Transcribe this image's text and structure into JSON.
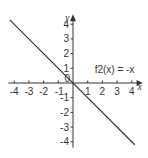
{
  "chart_data": {
    "type": "line",
    "title": "",
    "xlabel": "x",
    "ylabel": "y",
    "xlim": [
      -4.4,
      4.6
    ],
    "ylim": [
      -4.4,
      4.4
    ],
    "grid": false,
    "x_ticks": [
      -4,
      -3,
      -2,
      -1,
      0,
      1,
      2,
      3,
      4
    ],
    "y_ticks": [
      -4,
      -3,
      -2,
      -1,
      1,
      2,
      3,
      4
    ],
    "x_tick_labels": [
      "-4",
      "-3",
      "-2",
      "-1",
      "0",
      "1",
      "2",
      "3",
      "4"
    ],
    "y_tick_labels": [
      "-4",
      "-3",
      "-2",
      "-1",
      "1",
      "2",
      "3",
      "4"
    ],
    "series": [
      {
        "name": "f2(x) = -x",
        "x": [
          -4.3,
          4.2
        ],
        "y": [
          4.3,
          -4.2
        ],
        "color": "#333333"
      }
    ],
    "annotations": [
      {
        "text": "f2(x) = -x",
        "x": 1.2,
        "y": 0.9
      }
    ]
  },
  "colors": {
    "axis": "#333333",
    "line": "#333333",
    "text": "#333333",
    "background": "#ffffff"
  }
}
